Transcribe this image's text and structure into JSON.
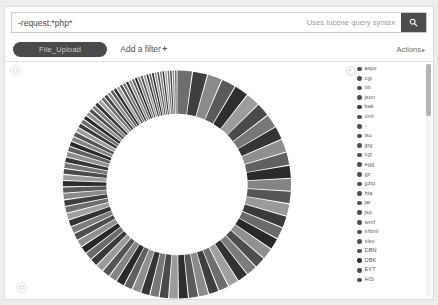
{
  "search": {
    "query_value": "-request:*php*",
    "placeholder": "",
    "hint": "Uses lucene query syntax",
    "search_icon": "search-icon"
  },
  "filter_bar": {
    "filter_label": "File_Upload",
    "add_filter_label": "Add a filter",
    "add_filter_plus": "+",
    "actions_label": "Actions",
    "actions_caret": "▸"
  },
  "chart_data": {
    "type": "pie",
    "variant": "donut",
    "title": "",
    "legend_position": "right",
    "labels": [
      "aspx",
      "cgi",
      "txt",
      "json",
      "bak",
      "xml",
      "-",
      "iso",
      "jpg",
      "cgi",
      "egg",
      "gz",
      "gzip",
      "hta",
      "jar",
      "jsp",
      "wmf",
      "xhtml",
      "xlsx",
      "DBN",
      "DBK",
      "EVT",
      "HIS"
    ],
    "colors": [
      "#6e6e6e",
      "#3f3f3f",
      "#8a8a8a",
      "#5a5a5a",
      "#2e2e2e",
      "#9c9c9c",
      "#4a4a4a",
      "#777777",
      "#353535",
      "#8f8f8f",
      "#606060",
      "#2a2a2a",
      "#848484",
      "#555555",
      "#9a9a9a",
      "#3a3a3a",
      "#6a6a6a",
      "#282828",
      "#909090",
      "#4e4e4e",
      "#7c7c7c",
      "#323232",
      "#a0a0a0"
    ],
    "values": [
      6.2,
      4.1,
      3.4,
      3.0,
      2.6,
      2.3,
      2.1,
      1.9,
      1.8,
      1.7,
      1.6,
      1.5,
      1.4,
      1.35,
      1.3,
      1.25,
      1.2,
      1.15,
      1.1,
      1.05,
      1.0,
      0.95,
      0.9
    ],
    "segment_count": 96,
    "inner_radius_ratio": 0.62
  },
  "legend": {
    "items": [
      {
        "label": "aspx",
        "color": "#4f4f4f"
      },
      {
        "label": "cgi",
        "color": "#4f4f4f"
      },
      {
        "label": "txt",
        "color": "#4f4f4f"
      },
      {
        "label": "json",
        "color": "#4f4f4f"
      },
      {
        "label": "bak",
        "color": "#3d3d3d"
      },
      {
        "label": "xml",
        "color": "#4f4f4f"
      },
      {
        "label": "-",
        "color": "#4f4f4f"
      },
      {
        "label": "iso",
        "color": "#4f4f4f"
      },
      {
        "label": "jpg",
        "color": "#4f4f4f"
      },
      {
        "label": "cgi",
        "color": "#4f4f4f"
      },
      {
        "label": "egg",
        "color": "#4f4f4f"
      },
      {
        "label": "gz",
        "color": "#4f4f4f"
      },
      {
        "label": "gzip",
        "color": "#4f4f4f"
      },
      {
        "label": "hta",
        "color": "#4f4f4f"
      },
      {
        "label": "jar",
        "color": "#4f4f4f"
      },
      {
        "label": "jsp",
        "color": "#4f4f4f"
      },
      {
        "label": "wmf",
        "color": "#4f4f4f"
      },
      {
        "label": "xhtml",
        "color": "#4f4f4f"
      },
      {
        "label": "xlsx",
        "color": "#4f4f4f"
      },
      {
        "label": "DBN",
        "color": "#4f4f4f"
      },
      {
        "label": "DBK",
        "color": "#2f2f2f"
      },
      {
        "label": "EVT",
        "color": "#4f4f4f"
      },
      {
        "label": "HIS",
        "color": "#4f4f4f"
      }
    ]
  }
}
